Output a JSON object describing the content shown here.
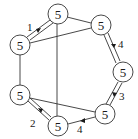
{
  "diagram": {
    "type": "graph",
    "node_radius": 10,
    "stroke_color": "#333333",
    "nodes": [
      {
        "id": "A",
        "label": "5",
        "x": 58,
        "y": 14
      },
      {
        "id": "B",
        "label": "5",
        "x": 101,
        "y": 25
      },
      {
        "id": "C",
        "label": "5",
        "x": 20,
        "y": 45
      },
      {
        "id": "D",
        "label": "5",
        "x": 123,
        "y": 72
      },
      {
        "id": "E",
        "label": "5",
        "x": 20,
        "y": 95
      },
      {
        "id": "F",
        "label": "5",
        "x": 105,
        "y": 114
      },
      {
        "id": "G",
        "label": "5",
        "x": 58,
        "y": 126
      }
    ],
    "edges": [
      {
        "from": "C",
        "to": "A",
        "style": "double",
        "label": "1",
        "arrow": "toward-A"
      },
      {
        "from": "A",
        "to": "B",
        "style": "single"
      },
      {
        "from": "A",
        "to": "G",
        "style": "single"
      },
      {
        "from": "C",
        "to": "B",
        "style": "single"
      },
      {
        "from": "C",
        "to": "E",
        "style": "single"
      },
      {
        "from": "B",
        "to": "D",
        "style": "double",
        "label": "4",
        "arrow": "toward-D"
      },
      {
        "from": "D",
        "to": "F",
        "style": "double",
        "label": "3",
        "arrow": "toward-F"
      },
      {
        "from": "F",
        "to": "G",
        "style": "single",
        "label": "4",
        "arrow": "toward-G"
      },
      {
        "from": "G",
        "to": "E",
        "style": "double",
        "label": "2",
        "arrow": "toward-E"
      },
      {
        "from": "E",
        "to": "F",
        "style": "single"
      }
    ],
    "edge_labels": {
      "ca": "1",
      "bd": "4",
      "df": "3",
      "fg": "4",
      "ge": "2"
    }
  }
}
